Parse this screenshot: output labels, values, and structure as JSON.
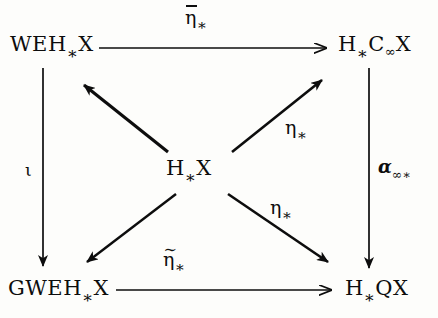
{
  "figure": {
    "type": "commutative-diagram",
    "background_color": "#fdfdfb",
    "ink_color": "#0d0d0d"
  },
  "nodes": [
    {
      "id": "top-left",
      "name": "node-weh-x",
      "text": "WEH∗X",
      "base": "WEH",
      "subscript": "∗",
      "tail": "X",
      "x": 10,
      "y": 34
    },
    {
      "id": "top-right",
      "name": "node-h-c-infinity-x",
      "text": "H∗C∞X",
      "base": "H",
      "subscript": "∗",
      "mid": "C",
      "mid_subscript": "∞",
      "tail": "X",
      "x": 338,
      "y": 34
    },
    {
      "id": "center",
      "name": "node-h-x",
      "text": "H∗X",
      "base": "H",
      "subscript": "∗",
      "tail": "X",
      "x": 166,
      "y": 158
    },
    {
      "id": "bottom-left",
      "name": "node-gweh-x",
      "text": "GWEH∗X",
      "base": "GWEH",
      "subscript": "∗",
      "tail": "X",
      "x": 8,
      "y": 278
    },
    {
      "id": "bottom-right",
      "name": "node-h-q-x",
      "text": "H∗QX",
      "base": "H",
      "subscript": "∗",
      "tail": "QX",
      "x": 345,
      "y": 278
    }
  ],
  "arrows": [
    {
      "id": "top-horizontal",
      "name": "arrow-top-horizontal",
      "from": "top-left",
      "to": "top-right",
      "label": "η̄∗",
      "label_base": "η",
      "label_accent": "bar",
      "label_subscript": "∗"
    },
    {
      "id": "bottom-horizontal",
      "name": "arrow-bottom-horizontal",
      "from": "bottom-left",
      "to": "bottom-right",
      "label": "η̃∗",
      "label_base": "η",
      "label_accent": "tilde",
      "label_subscript": "∗"
    },
    {
      "id": "left-vertical",
      "name": "arrow-left-vertical",
      "from": "top-left",
      "to": "bottom-left",
      "label": "ι",
      "label_base": "ι",
      "label_accent": "none",
      "label_subscript": ""
    },
    {
      "id": "right-vertical",
      "name": "arrow-right-vertical",
      "from": "top-right",
      "to": "bottom-right",
      "label": "α∞∗",
      "label_base": "α",
      "label_accent": "none",
      "label_subscript": "∞∗"
    },
    {
      "id": "center-to-top-left",
      "name": "arrow-center-to-top-left",
      "from": "center",
      "to": "top-left",
      "label": "",
      "label_base": "",
      "label_accent": "none",
      "label_subscript": ""
    },
    {
      "id": "center-to-top-right",
      "name": "arrow-center-to-top-right",
      "from": "center",
      "to": "top-right",
      "label": "η∗",
      "label_base": "η",
      "label_accent": "none",
      "label_subscript": "∗"
    },
    {
      "id": "center-to-bottom-left",
      "name": "arrow-center-to-bottom-left",
      "from": "center",
      "to": "bottom-left",
      "label": "",
      "label_base": "",
      "label_accent": "none",
      "label_subscript": ""
    },
    {
      "id": "center-to-bottom-right",
      "name": "arrow-center-to-bottom-right",
      "from": "center",
      "to": "bottom-right",
      "label": "η∗",
      "label_base": "η",
      "label_accent": "none",
      "label_subscript": "∗"
    }
  ],
  "labels": {
    "top_arrow": {
      "base": "η",
      "sub": "∗"
    },
    "bottom_arrow": {
      "base": "η",
      "sub": "∗"
    },
    "left_arrow": {
      "base": "ι"
    },
    "right_arrow": {
      "base": "α",
      "sub": "∞∗"
    },
    "diagonal_up_right": {
      "base": "η",
      "sub": "∗"
    },
    "diagonal_down_right": {
      "base": "η",
      "sub": "∗"
    },
    "tilde_glyph": "∼"
  }
}
